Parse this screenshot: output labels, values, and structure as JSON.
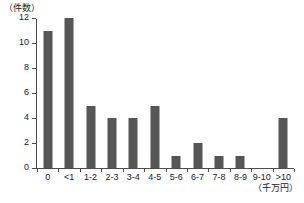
{
  "chart_data": {
    "type": "bar",
    "title": "",
    "subtitle": "",
    "xlabel": "（千万円）",
    "ylabel": "（件数）",
    "categories": [
      "0",
      "<1",
      "1-2",
      "2-3",
      "3-4",
      "4-5",
      "5-6",
      "6-7",
      "7-8",
      "8-9",
      "9-10",
      ">10"
    ],
    "values": [
      11,
      12,
      5,
      4,
      4,
      5,
      1,
      2,
      1,
      1,
      0,
      4
    ],
    "ylim": [
      0,
      12
    ],
    "ytick_labels": [
      "0",
      "2",
      "4",
      "6",
      "8",
      "10",
      "12"
    ],
    "ytick_values": [
      0,
      2,
      4,
      6,
      8,
      10,
      12
    ],
    "grid": false,
    "legend": null,
    "bar_color": "#565656",
    "axis_color": "#4d4d4d",
    "background_color": "#ffffff"
  }
}
